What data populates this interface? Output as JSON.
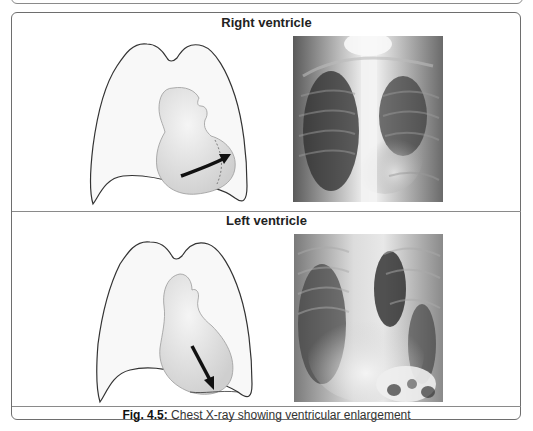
{
  "figure": {
    "panels": [
      {
        "id": "right",
        "title": "Right ventricle",
        "diagram": {
          "icon": "lungs-heart-diagram-icon",
          "arrow_direction": "rightward-outward"
        },
        "xray": {
          "icon": "chest-xray-image-icon"
        }
      },
      {
        "id": "left",
        "title": "Left ventricle",
        "diagram": {
          "icon": "lungs-heart-diagram-icon",
          "arrow_direction": "downward-outward"
        },
        "xray": {
          "icon": "chest-xray-image-icon"
        }
      }
    ],
    "caption": {
      "label": "Fig. 4.5:",
      "text": " Chest X-ray showing ventricular enlargement"
    }
  },
  "colors": {
    "border": "#6e6e6e",
    "lung_fill": "#f7f7f7",
    "heart_fill": "#e6e6e6",
    "arrow": "#111111"
  }
}
